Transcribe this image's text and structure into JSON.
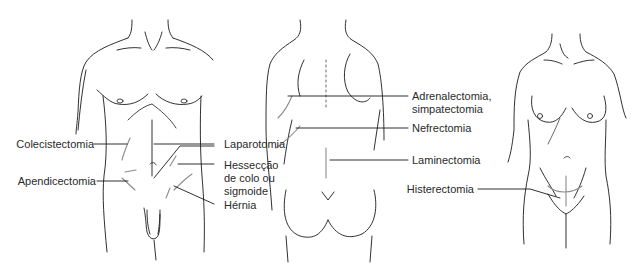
{
  "figure": {
    "panels": [
      {
        "name": "male-front-torso"
      },
      {
        "name": "back-torso"
      },
      {
        "name": "female-front-torso"
      }
    ],
    "labels": {
      "colecistectomia": "Colecistectomia",
      "apendicectomia": "Apendicectomia",
      "laparotomia": "Laparotomia",
      "hesseccao_line1": "Hessecção",
      "hesseccao_line2": "de colo ou",
      "hesseccao_line3": "sigmoide",
      "hernia": "Hérnia",
      "adrenalectomia_line1": "Adrenalectomia,",
      "adrenalectomia_line2": "simpatectomia",
      "nefrectomia": "Nefrectomia",
      "laminectomia": "Laminectomia",
      "histerectomia": "Histerectomia"
    },
    "caption": "",
    "colors": {
      "line": "#1a1a1a",
      "incision": "#8a8a8a",
      "text": "#2a2a2a"
    }
  }
}
